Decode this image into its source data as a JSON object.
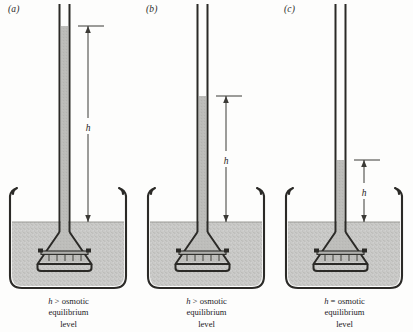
{
  "figure": {
    "type": "osmosis-diagram",
    "background_color": "#fdfdfc",
    "ink_color": "#2b2a27",
    "liquid_color": "#c9c9c7",
    "column_color": "#b9b9b6",
    "panel_count": 3
  },
  "panels": [
    {
      "id": "a",
      "label": "(a)",
      "dimension_symbol": "h",
      "column_top_y": 26,
      "liquid_surface_y": 222,
      "column_height_px": 196,
      "relation": "greater",
      "caption_line1_symbol": "h",
      "caption_line1_relation": ">",
      "caption_line1_word": "osmotic",
      "caption_line2": "equilibrium",
      "caption_line3": "level",
      "caption_full": "h > osmotic equilibrium level"
    },
    {
      "id": "b",
      "label": "(b)",
      "dimension_symbol": "h",
      "column_top_y": 96,
      "liquid_surface_y": 222,
      "column_height_px": 126,
      "relation": "greater",
      "caption_line1_symbol": "h",
      "caption_line1_relation": ">",
      "caption_line1_word": "osmotic",
      "caption_line2": "equilibrium",
      "caption_line3": "level",
      "caption_full": "h > osmotic equilibrium level"
    },
    {
      "id": "c",
      "label": "(c)",
      "dimension_symbol": "h",
      "column_top_y": 160,
      "liquid_surface_y": 222,
      "column_height_px": 62,
      "relation": "equal",
      "caption_line1_symbol": "h",
      "caption_line1_relation": "=",
      "caption_line1_word": "osmotic",
      "caption_line2": "equilibrium",
      "caption_line3": "level",
      "caption_full": "h = osmotic equilibrium level"
    }
  ],
  "apparatus": {
    "beaker_name": "beaker",
    "tube_name": "capillary-tube",
    "funnel_name": "funnel-bulb",
    "membrane_name": "semipermeable-membrane",
    "liquid_name": "solvent-bath",
    "column_name": "solution-column",
    "dimension_name": "height-dimension-h"
  }
}
